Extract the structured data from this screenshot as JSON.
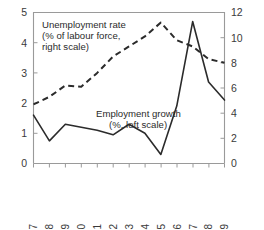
{
  "chart_data": {
    "type": "line",
    "title": "",
    "subtitle": "",
    "xlabel": "",
    "ylabel": "",
    "y2label": "",
    "grid": false,
    "legend_position": "inline-annotation",
    "x": [
      1997,
      1998,
      1999,
      2000,
      2001,
      2002,
      2003,
      2004,
      2005,
      2006,
      2007,
      2008,
      2009
    ],
    "xtick_labels": [
      "1997",
      "1998",
      "1999",
      "2000",
      "2001",
      "2002",
      "2003",
      "2004",
      "2005",
      "2006",
      "2007",
      "2008",
      "2009"
    ],
    "xlim": [
      1997,
      2009
    ],
    "left_axis": {
      "ticks": [
        0,
        1,
        2,
        3,
        4,
        5
      ],
      "tick_labels": [
        "0",
        "1",
        "2",
        "3",
        "4",
        "5"
      ],
      "ylim": [
        0,
        5
      ]
    },
    "right_axis": {
      "ticks": [
        0,
        2,
        4,
        6,
        8,
        10,
        12
      ],
      "tick_labels": [
        "0",
        "2",
        "4",
        "6",
        "8",
        "10",
        "12"
      ],
      "ylim": [
        0,
        12
      ]
    },
    "series": [
      {
        "name": "Employment growth",
        "axis": "left",
        "style": "solid",
        "color": "#2b2b2b",
        "values": [
          1.6,
          0.75,
          1.3,
          1.2,
          1.1,
          0.95,
          1.3,
          1.0,
          0.3,
          1.9,
          4.7,
          2.7,
          2.1
        ]
      },
      {
        "name": "Unemployment rate",
        "axis": "right",
        "style": "dashed",
        "color": "#2b2b2b",
        "values": [
          4.7,
          5.3,
          6.2,
          6.1,
          7.2,
          8.5,
          9.3,
          10.1,
          11.2,
          9.8,
          9.3,
          8.3,
          8.0
        ]
      }
    ],
    "annotations": [
      {
        "name": "unemployment-label",
        "lines": [
          "Unemployment rate",
          "(% of labour force,",
          "right scale)"
        ],
        "x": 42,
        "y": 24
      },
      {
        "name": "employment-label",
        "lines": [
          "Employment growth",
          "(%, left scale)"
        ],
        "x": 96,
        "y": 114
      }
    ],
    "colors": {
      "axis": "#9a9a9a",
      "text": "#3a3a3a",
      "line": "#2b2b2b",
      "background": "#ffffff"
    }
  }
}
